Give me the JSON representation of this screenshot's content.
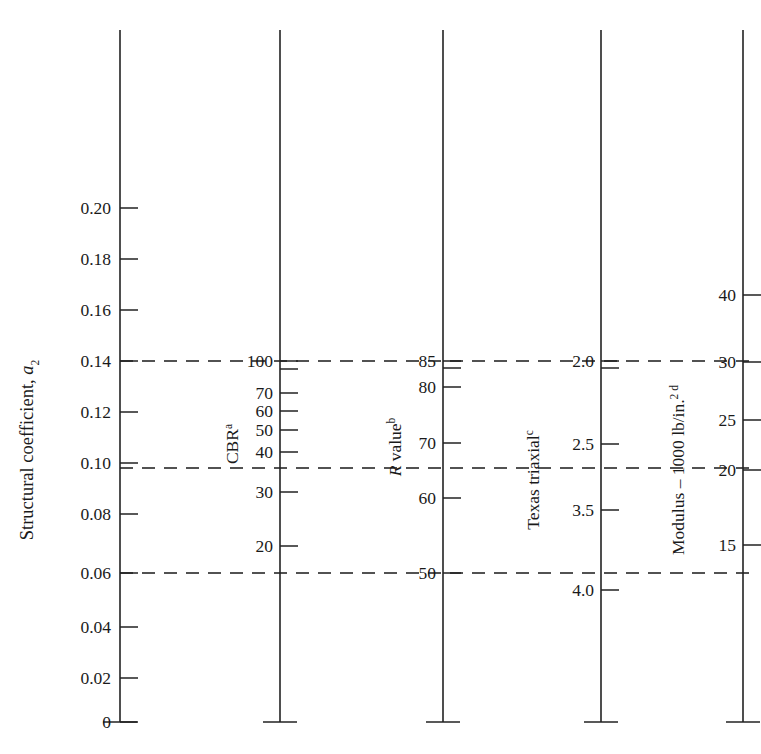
{
  "chart_data": {
    "type": "nomograph",
    "title": "",
    "ylabel": "Structural coefficient, a2",
    "ylabel_main": "Structural coefficient, ",
    "ylabel_sym": "a",
    "ylabel_sub": "2",
    "ylim": [
      0,
      0.22
    ],
    "grid": false,
    "legend": "none",
    "guide_lines": [
      {
        "value": 0.14,
        "label": "0.14",
        "crosses": {
          "cbr": 100,
          "r_value": 85,
          "texas_triaxial": 2.0,
          "modulus": 30
        }
      },
      {
        "value": 0.1,
        "label": "0.10",
        "crosses": {
          "cbr": 35,
          "r_value": 67,
          "texas_triaxial": 2.6,
          "modulus": 20.5
        }
      },
      {
        "value": 0.06,
        "label": "0.06",
        "crosses": {
          "cbr": 16,
          "r_value": 50,
          "texas_triaxial": 3.9,
          "modulus": 13.5
        }
      }
    ],
    "axes": [
      {
        "id": "structural-coefficient",
        "title": "Structural coefficient, a2",
        "title_plain": "Structural coefficient, ",
        "title_sym": "a",
        "title_sub": "2",
        "footnote": "",
        "side": "left",
        "ticks": [
          {
            "label": "0.20",
            "value": 0.2
          },
          {
            "label": "0.18",
            "value": 0.18
          },
          {
            "label": "0.16",
            "value": 0.16
          },
          {
            "label": "0.14",
            "value": 0.14
          },
          {
            "label": "0.12",
            "value": 0.12
          },
          {
            "label": "0.10",
            "value": 0.1
          },
          {
            "label": "0.08",
            "value": 0.08
          },
          {
            "label": "0.06",
            "value": 0.06
          },
          {
            "label": "0.04",
            "value": 0.04
          },
          {
            "label": "0.02",
            "value": 0.02
          },
          {
            "label": "0",
            "value": 0.0
          }
        ]
      },
      {
        "id": "cbr",
        "title": "CBR",
        "footnote": "a",
        "side": "right",
        "ticks": [
          {
            "label": "100",
            "value": 100
          },
          {
            "label": "",
            "value": 90
          },
          {
            "label": "70",
            "value": 70
          },
          {
            "label": "60",
            "value": 60
          },
          {
            "label": "50",
            "value": 50
          },
          {
            "label": "40",
            "value": 40
          },
          {
            "label": "30",
            "value": 30
          },
          {
            "label": "20",
            "value": 20
          }
        ]
      },
      {
        "id": "r-value",
        "title": "R value",
        "title_sym": "R",
        "title_plain": " value",
        "footnote": "b",
        "side": "right",
        "ticks": [
          {
            "label": "85",
            "value": 85
          },
          {
            "label": "",
            "value": 83
          },
          {
            "label": "80",
            "value": 80
          },
          {
            "label": "70",
            "value": 70
          },
          {
            "label": "60",
            "value": 60
          },
          {
            "label": "50",
            "value": 50
          }
        ]
      },
      {
        "id": "texas-triaxial",
        "title": "Texas triaxial",
        "footnote": "c",
        "side": "right",
        "ticks": [
          {
            "label": "2.0",
            "value": 2.0
          },
          {
            "label": "",
            "value": 2.1
          },
          {
            "label": "2.5",
            "value": 2.5
          },
          {
            "label": "3.5",
            "value": 3.5
          },
          {
            "label": "4.0",
            "value": 4.0
          }
        ]
      },
      {
        "id": "modulus",
        "title": "Modulus – 1000 lb/in.",
        "title_sup": "2 d",
        "footnote": "d",
        "side": "right",
        "ticks": [
          {
            "label": "40",
            "value": 40
          },
          {
            "label": "30",
            "value": 30
          },
          {
            "label": "25",
            "value": 25
          },
          {
            "label": "20",
            "value": 20
          },
          {
            "label": "15",
            "value": 15
          }
        ]
      }
    ]
  },
  "geometry": {
    "axis_x": [
      120,
      280,
      443,
      601,
      743
    ],
    "axis_top_y": 30,
    "axis_bottom_y": 722,
    "tick_len": 18,
    "base_tick_half": 17,
    "left_ticks_y": [
      208,
      259,
      310,
      361,
      412,
      463,
      514,
      573,
      627,
      678,
      722
    ],
    "cbr_ticks_y": [
      361,
      369,
      393,
      411,
      430,
      452,
      492,
      546
    ],
    "cbr_labels": [
      "100",
      "",
      "70",
      "60",
      "50",
      "40",
      "30",
      "20"
    ],
    "r_ticks_y": [
      361,
      368,
      387,
      443,
      498,
      573
    ],
    "r_labels": [
      "85",
      "",
      "80",
      "70",
      "60",
      "50"
    ],
    "tx_ticks_y": [
      361,
      368,
      444,
      510,
      590
    ],
    "tx_labels": [
      "2.0",
      "",
      "2.5",
      "3.5",
      "4.0"
    ],
    "mod_ticks_y": [
      295,
      362,
      420,
      470,
      545
    ],
    "mod_labels": [
      "40",
      "30",
      "25",
      "20",
      "15"
    ],
    "dash_y": [
      361,
      468,
      573
    ]
  },
  "colors": {
    "ink": "#1a1a1a",
    "line": "#222222",
    "background": "#ffffff"
  }
}
